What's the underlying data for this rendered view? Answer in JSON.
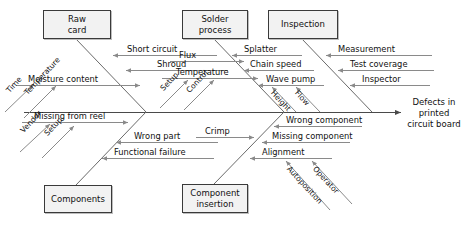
{
  "diagram": {
    "type": "fishbone-ishikawa",
    "effect": "Defects in\nprinted\ncircuit board",
    "categories": [
      {
        "id": "raw-card",
        "label": "Raw\ncard",
        "position": "top-left"
      },
      {
        "id": "solder-process",
        "label": "Solder\nprocess",
        "position": "top-middle"
      },
      {
        "id": "inspection",
        "label": "Inspection",
        "position": "top-right"
      },
      {
        "id": "components",
        "label": "Components",
        "position": "bottom-left"
      },
      {
        "id": "component-insertion",
        "label": "Component\ninsertion",
        "position": "bottom-middle"
      }
    ],
    "causes": {
      "raw_card": [
        "Short circuit",
        "Shroud",
        "Moisture content"
      ],
      "solder_process": [
        "Flux",
        "Splatter",
        "Chain speed",
        "Temperature",
        "Wave pump"
      ],
      "inspection": [
        "Measurement",
        "Test coverage",
        "Inspector"
      ],
      "components": [
        "Missing from reel",
        "Wrong part",
        "Functional failure"
      ],
      "component_insertion": [
        "Crimp",
        "Wrong component",
        "Missing component",
        "Alignment"
      ]
    },
    "sub_causes": {
      "moisture_content": [
        "Time",
        "Temperature"
      ],
      "missing_from_reel": [
        "Vendor",
        "Setup"
      ],
      "solder_temperature": [
        "Setup",
        "Control"
      ],
      "wave_pump": [
        "Height",
        "Flow"
      ],
      "alignment": [
        "Autoposition",
        "Operator"
      ]
    },
    "colors": {
      "box_fill": "#f2f2f2",
      "box_border": "#3a3a3a",
      "spine": "#4a4a4a",
      "rib": "#6a6a6a",
      "twig": "#8a8a8a",
      "text": "#111111",
      "background": "#ffffff"
    }
  }
}
